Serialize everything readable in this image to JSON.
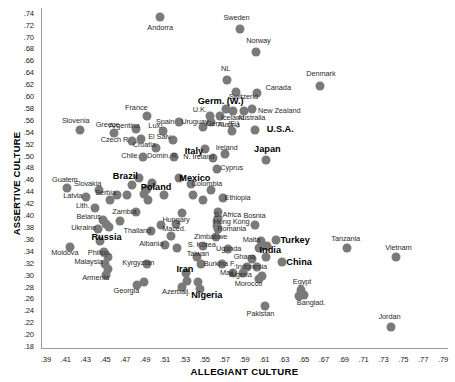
{
  "chart_data": {
    "type": "scatter",
    "title": "",
    "xlabel": "ALLEGIANT CULTURE",
    "ylabel": "ASSERTIVE CULTURE",
    "xlim": [
      0.385,
      0.795
    ],
    "ylim": [
      0.175,
      0.748
    ],
    "xticks": [
      ".39",
      ".41",
      ".43",
      ".45",
      ".47",
      ".49",
      ".51",
      ".53",
      ".55",
      ".57",
      ".59",
      ".61",
      ".63",
      ".65",
      ".67",
      ".69",
      ".71",
      ".73",
      ".75",
      ".77",
      ".79"
    ],
    "yticks": [
      ".74",
      ".72",
      ".70",
      ".68",
      ".66",
      ".64",
      ".62",
      ".60",
      ".58",
      ".56",
      ".54",
      ".52",
      ".50",
      ".48",
      ".46",
      ".44",
      ".42",
      ".40",
      ".38",
      ".36",
      ".34",
      ".32",
      ".30",
      ".28",
      ".26",
      ".24",
      ".22",
      ".20",
      ".18"
    ],
    "grid": false,
    "legend": "none",
    "marker_color": "#7a7a7a",
    "axis_color": "#9a9a9a",
    "points": [
      {
        "label": "Andorra",
        "x": 0.505,
        "y": 0.733,
        "emphasis": false,
        "lx": 0.505,
        "ly": 0.714
      },
      {
        "label": "Sweden",
        "x": 0.585,
        "y": 0.712,
        "emphasis": false,
        "lx": 0.582,
        "ly": 0.732
      },
      {
        "label": "Norway",
        "x": 0.602,
        "y": 0.674,
        "emphasis": false,
        "lx": 0.604,
        "ly": 0.692
      },
      {
        "label": "Denmark",
        "x": 0.666,
        "y": 0.617,
        "emphasis": false,
        "lx": 0.667,
        "ly": 0.637
      },
      {
        "label": "NL",
        "x": 0.572,
        "y": 0.627,
        "emphasis": false,
        "lx": 0.571,
        "ly": 0.646
      },
      {
        "label": "Canada",
        "x": 0.603,
        "y": 0.605,
        "emphasis": false,
        "lx": 0.624,
        "ly": 0.613
      },
      {
        "label": "Switzerld",
        "x": 0.581,
        "y": 0.607,
        "emphasis": false,
        "lx": 0.589,
        "ly": 0.598
      },
      {
        "label": "Germ. (W.)",
        "x": 0.571,
        "y": 0.578,
        "emphasis": true,
        "lx": 0.566,
        "ly": 0.592
      },
      {
        "label": "New Zealand",
        "x": 0.598,
        "y": 0.578,
        "emphasis": false,
        "lx": 0.625,
        "ly": 0.575
      },
      {
        "label": "Australia",
        "x": 0.589,
        "y": 0.575,
        "emphasis": false,
        "lx": 0.597,
        "ly": 0.563
      },
      {
        "label": "Iceland",
        "x": 0.578,
        "y": 0.575,
        "emphasis": false,
        "lx": 0.578,
        "ly": 0.563
      },
      {
        "label": "Germ. (E.)",
        "x": 0.565,
        "y": 0.566,
        "emphasis": false,
        "lx": 0.568,
        "ly": 0.553
      },
      {
        "label": "U.K.",
        "x": 0.555,
        "y": 0.566,
        "emphasis": false,
        "lx": 0.545,
        "ly": 0.577
      },
      {
        "label": "France",
        "x": 0.492,
        "y": 0.566,
        "emphasis": false,
        "lx": 0.481,
        "ly": 0.58
      },
      {
        "label": "Spain",
        "x": 0.524,
        "y": 0.556,
        "emphasis": false,
        "lx": 0.51,
        "ly": 0.557
      },
      {
        "label": "Slovenia",
        "x": 0.424,
        "y": 0.543,
        "emphasis": false,
        "lx": 0.42,
        "ly": 0.558
      },
      {
        "label": "U.S.A.",
        "x": 0.601,
        "y": 0.543,
        "emphasis": true,
        "lx": 0.626,
        "ly": 0.545
      },
      {
        "label": "Austria",
        "x": 0.577,
        "y": 0.542,
        "emphasis": false,
        "lx": 0.574,
        "ly": 0.551
      },
      {
        "label": "Uruguay",
        "x": 0.548,
        "y": 0.548,
        "emphasis": false,
        "lx": 0.54,
        "ly": 0.557
      },
      {
        "label": "Lux.",
        "x": 0.508,
        "y": 0.542,
        "emphasis": false,
        "lx": 0.5,
        "ly": 0.549
      },
      {
        "label": "Argentina",
        "x": 0.481,
        "y": 0.545,
        "emphasis": false,
        "lx": 0.469,
        "ly": 0.549
      },
      {
        "label": "Greece",
        "x": 0.459,
        "y": 0.538,
        "emphasis": false,
        "lx": 0.452,
        "ly": 0.551
      },
      {
        "label": "Germ. (E.) 2",
        "x": 0.556,
        "y": 0.557,
        "emphasis": false,
        "lx": 0.556,
        "ly": 0.557,
        "hidden": true
      },
      {
        "label": "El Salv.",
        "x": 0.518,
        "y": 0.527,
        "emphasis": false,
        "lx": 0.505,
        "ly": 0.531
      },
      {
        "label": "Czech R.",
        "x": 0.477,
        "y": 0.525,
        "emphasis": false,
        "lx": 0.46,
        "ly": 0.527
      },
      {
        "label": "Czech2",
        "x": 0.486,
        "y": 0.528,
        "emphasis": false,
        "lx": 0.486,
        "ly": 0.528,
        "hidden": true
      },
      {
        "label": "Italy",
        "x": 0.55,
        "y": 0.511,
        "emphasis": true,
        "lx": 0.539,
        "ly": 0.508
      },
      {
        "label": "Ireland",
        "x": 0.57,
        "y": 0.503,
        "emphasis": false,
        "lx": 0.572,
        "ly": 0.513
      },
      {
        "label": "Japan",
        "x": 0.612,
        "y": 0.493,
        "emphasis": true,
        "lx": 0.613,
        "ly": 0.511
      },
      {
        "label": "Croatia",
        "x": 0.501,
        "y": 0.513,
        "emphasis": false,
        "lx": 0.489,
        "ly": 0.518
      },
      {
        "label": "Chile",
        "x": 0.488,
        "y": 0.498,
        "emphasis": false,
        "lx": 0.474,
        "ly": 0.5
      },
      {
        "label": "Domin. R.",
        "x": 0.519,
        "y": 0.497,
        "emphasis": false,
        "lx": 0.508,
        "ly": 0.5
      },
      {
        "label": "N. Ireland",
        "x": 0.558,
        "y": 0.496,
        "emphasis": false,
        "lx": 0.544,
        "ly": 0.498
      },
      {
        "label": "Brazil",
        "x": 0.484,
        "y": 0.462,
        "emphasis": true,
        "lx": 0.47,
        "ly": 0.466
      },
      {
        "label": "Mexico",
        "x": 0.524,
        "y": 0.463,
        "emphasis": true,
        "lx": 0.54,
        "ly": 0.462
      },
      {
        "label": "Cyprus",
        "x": 0.562,
        "y": 0.478,
        "emphasis": false,
        "lx": 0.577,
        "ly": 0.479
      },
      {
        "label": "Guatem.",
        "x": 0.411,
        "y": 0.445,
        "emphasis": false,
        "lx": 0.41,
        "ly": 0.459
      },
      {
        "label": "Slovakia",
        "x": 0.443,
        "y": 0.443,
        "emphasis": false,
        "lx": 0.432,
        "ly": 0.452
      },
      {
        "label": "Poland",
        "x": 0.492,
        "y": 0.444,
        "emphasis": true,
        "lx": 0.501,
        "ly": 0.448
      },
      {
        "label": "Colombia",
        "x": 0.556,
        "y": 0.442,
        "emphasis": false,
        "lx": 0.552,
        "ly": 0.452
      },
      {
        "label": "Latvia",
        "x": 0.43,
        "y": 0.43,
        "emphasis": false,
        "lx": 0.417,
        "ly": 0.432
      },
      {
        "label": "Serbia",
        "x": 0.462,
        "y": 0.433,
        "emphasis": false,
        "lx": 0.45,
        "ly": 0.437
      },
      {
        "label": "Ethiopia",
        "x": 0.568,
        "y": 0.428,
        "emphasis": false,
        "lx": 0.583,
        "ly": 0.428
      },
      {
        "label": "Lith.",
        "x": 0.439,
        "y": 0.412,
        "emphasis": false,
        "lx": 0.427,
        "ly": 0.415
      },
      {
        "label": "Zambia",
        "x": 0.481,
        "y": 0.406,
        "emphasis": false,
        "lx": 0.469,
        "ly": 0.405
      },
      {
        "label": "Hungary",
        "x": 0.527,
        "y": 0.403,
        "emphasis": false,
        "lx": 0.521,
        "ly": 0.392
      },
      {
        "label": "S. Africa",
        "x": 0.563,
        "y": 0.405,
        "emphasis": false,
        "lx": 0.573,
        "ly": 0.4
      },
      {
        "label": "Belarus",
        "x": 0.447,
        "y": 0.392,
        "emphasis": false,
        "lx": 0.433,
        "ly": 0.397
      },
      {
        "label": "Hong Kong",
        "x": 0.562,
        "y": 0.39,
        "emphasis": false,
        "lx": 0.577,
        "ly": 0.388
      },
      {
        "label": "Maced.",
        "x": 0.521,
        "y": 0.385,
        "emphasis": false,
        "lx": 0.519,
        "ly": 0.377
      },
      {
        "label": "Ukraine",
        "x": 0.442,
        "y": 0.376,
        "emphasis": false,
        "lx": 0.428,
        "ly": 0.378
      },
      {
        "label": "Thailand",
        "x": 0.496,
        "y": 0.373,
        "emphasis": false,
        "lx": 0.482,
        "ly": 0.374
      },
      {
        "label": "Romania",
        "x": 0.563,
        "y": 0.376,
        "emphasis": false,
        "lx": 0.577,
        "ly": 0.376
      },
      {
        "label": "Bosnia",
        "x": 0.601,
        "y": 0.383,
        "emphasis": false,
        "lx": 0.6,
        "ly": 0.399
      },
      {
        "label": "Russia",
        "x": 0.444,
        "y": 0.357,
        "emphasis": true,
        "lx": 0.451,
        "ly": 0.363
      },
      {
        "label": "Zimbabwe",
        "x": 0.561,
        "y": 0.363,
        "emphasis": false,
        "lx": 0.556,
        "ly": 0.364
      },
      {
        "label": "Malta",
        "x": 0.607,
        "y": 0.357,
        "emphasis": false,
        "lx": 0.597,
        "ly": 0.358
      },
      {
        "label": "Turkey",
        "x": 0.622,
        "y": 0.358,
        "emphasis": true,
        "lx": 0.641,
        "ly": 0.358
      },
      {
        "label": "Tanzania",
        "x": 0.693,
        "y": 0.345,
        "emphasis": false,
        "lx": 0.692,
        "ly": 0.36
      },
      {
        "label": "Albania",
        "x": 0.51,
        "y": 0.35,
        "emphasis": false,
        "lx": 0.496,
        "ly": 0.352
      },
      {
        "label": "S. Korea",
        "x": 0.548,
        "y": 0.348,
        "emphasis": false,
        "lx": 0.547,
        "ly": 0.35
      },
      {
        "label": "Uganda",
        "x": 0.573,
        "y": 0.343,
        "emphasis": false,
        "lx": 0.574,
        "ly": 0.343
      },
      {
        "label": "Moldova",
        "x": 0.414,
        "y": 0.346,
        "emphasis": false,
        "lx": 0.409,
        "ly": 0.337
      },
      {
        "label": "Philipp.",
        "x": 0.448,
        "y": 0.338,
        "emphasis": false,
        "lx": 0.444,
        "ly": 0.337
      },
      {
        "label": "Vietnam",
        "x": 0.743,
        "y": 0.33,
        "emphasis": false,
        "lx": 0.745,
        "ly": 0.345
      },
      {
        "label": "India",
        "x": 0.612,
        "y": 0.33,
        "emphasis": true,
        "lx": 0.616,
        "ly": 0.341
      },
      {
        "label": "Taiwan",
        "x": 0.542,
        "y": 0.33,
        "emphasis": false,
        "lx": 0.543,
        "ly": 0.335
      },
      {
        "label": "Ghana",
        "x": 0.598,
        "y": 0.326,
        "emphasis": false,
        "lx": 0.59,
        "ly": 0.329
      },
      {
        "label": "China",
        "x": 0.628,
        "y": 0.322,
        "emphasis": true,
        "lx": 0.645,
        "ly": 0.322
      },
      {
        "label": "Malaysia",
        "x": 0.449,
        "y": 0.318,
        "emphasis": false,
        "lx": 0.433,
        "ly": 0.321
      },
      {
        "label": "Kyrgyztan",
        "x": 0.492,
        "y": 0.318,
        "emphasis": false,
        "lx": 0.483,
        "ly": 0.319
      },
      {
        "label": "Burkina F.",
        "x": 0.567,
        "y": 0.317,
        "emphasis": false,
        "lx": 0.565,
        "ly": 0.318
      },
      {
        "label": "Indonesia",
        "x": 0.603,
        "y": 0.312,
        "emphasis": false,
        "lx": 0.597,
        "ly": 0.313
      },
      {
        "label": "Iran",
        "x": 0.531,
        "y": 0.302,
        "emphasis": true,
        "lx": 0.53,
        "ly": 0.31
      },
      {
        "label": "Algeria",
        "x": 0.578,
        "y": 0.302,
        "emphasis": false,
        "lx": 0.586,
        "ly": 0.3
      },
      {
        "label": "Mali",
        "x": 0.588,
        "y": 0.302,
        "emphasis": false,
        "lx": 0.572,
        "ly": 0.302
      },
      {
        "label": "Armenia",
        "x": 0.45,
        "y": 0.3,
        "emphasis": false,
        "lx": 0.44,
        "ly": 0.294
      },
      {
        "label": "Morocco",
        "x": 0.605,
        "y": 0.293,
        "emphasis": false,
        "lx": 0.594,
        "ly": 0.285
      },
      {
        "label": "Egypt",
        "x": 0.647,
        "y": 0.274,
        "emphasis": false,
        "lx": 0.648,
        "ly": 0.288
      },
      {
        "label": "Georgia",
        "x": 0.482,
        "y": 0.283,
        "emphasis": false,
        "lx": 0.471,
        "ly": 0.272
      },
      {
        "label": "Azerbaij.",
        "x": 0.527,
        "y": 0.28,
        "emphasis": false,
        "lx": 0.521,
        "ly": 0.27
      },
      {
        "label": "Nigeria",
        "x": 0.545,
        "y": 0.276,
        "emphasis": true,
        "lx": 0.552,
        "ly": 0.266
      },
      {
        "label": "Banglad.",
        "x": 0.65,
        "y": 0.265,
        "emphasis": false,
        "lx": 0.657,
        "ly": 0.252
      },
      {
        "label": "Pakistan",
        "x": 0.611,
        "y": 0.248,
        "emphasis": false,
        "lx": 0.606,
        "ly": 0.233
      },
      {
        "label": "Jordan",
        "x": 0.738,
        "y": 0.212,
        "emphasis": false,
        "lx": 0.736,
        "ly": 0.228
      }
    ],
    "extra_points": [
      {
        "x": 0.497,
        "y": 0.454
      },
      {
        "x": 0.477,
        "y": 0.45
      },
      {
        "x": 0.489,
        "y": 0.436
      },
      {
        "x": 0.472,
        "y": 0.434
      },
      {
        "x": 0.455,
        "y": 0.425
      },
      {
        "x": 0.493,
        "y": 0.425
      },
      {
        "x": 0.509,
        "y": 0.434
      },
      {
        "x": 0.538,
        "y": 0.434
      },
      {
        "x": 0.45,
        "y": 0.385
      },
      {
        "x": 0.454,
        "y": 0.38
      },
      {
        "x": 0.465,
        "y": 0.39
      },
      {
        "x": 0.506,
        "y": 0.383
      },
      {
        "x": 0.516,
        "y": 0.365
      },
      {
        "x": 0.563,
        "y": 0.395
      },
      {
        "x": 0.562,
        "y": 0.382
      },
      {
        "x": 0.452,
        "y": 0.33
      },
      {
        "x": 0.452,
        "y": 0.31
      },
      {
        "x": 0.522,
        "y": 0.345
      },
      {
        "x": 0.605,
        "y": 0.345
      },
      {
        "x": 0.613,
        "y": 0.348
      },
      {
        "x": 0.593,
        "y": 0.313
      },
      {
        "x": 0.546,
        "y": 0.318
      },
      {
        "x": 0.532,
        "y": 0.29
      },
      {
        "x": 0.543,
        "y": 0.288
      },
      {
        "x": 0.489,
        "y": 0.288
      },
      {
        "x": 0.608,
        "y": 0.297
      },
      {
        "x": 0.645,
        "y": 0.264
      },
      {
        "x": 0.536,
        "y": 0.452
      },
      {
        "x": 0.548,
        "y": 0.425
      }
    ]
  }
}
